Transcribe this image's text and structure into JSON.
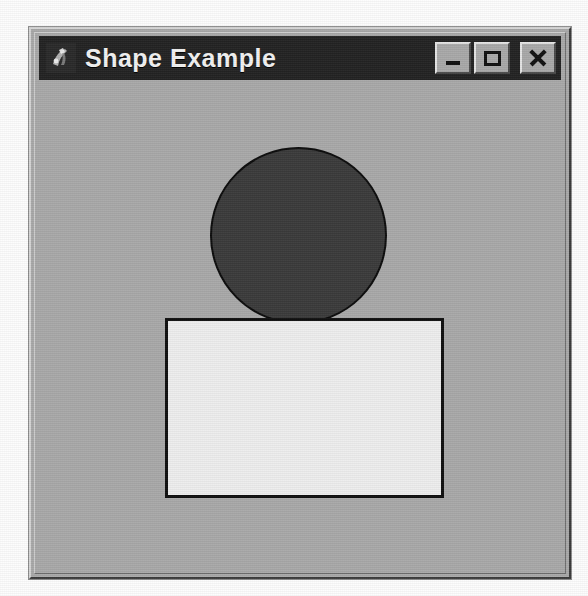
{
  "window": {
    "title": "Shape Example",
    "icon": "application-icon",
    "frame_color": "#a9a9a9",
    "titlebar_color": "#232323",
    "title_text_color": "#f2f2f2"
  },
  "window_controls": [
    {
      "name": "minimize",
      "label": "_",
      "glyph": "minimize-icon"
    },
    {
      "name": "maximize",
      "label": "□",
      "glyph": "maximize-icon"
    },
    {
      "name": "close",
      "label": "×",
      "glyph": "close-icon"
    }
  ],
  "canvas": {
    "background_color": "#a9a9a9",
    "shapes": [
      {
        "name": "circle",
        "type": "ellipse",
        "fill": "#3b3b3b",
        "outline": "#0c0c0c",
        "center_x": 292,
        "center_y": 229,
        "diameter": 177
      },
      {
        "name": "rectangle",
        "type": "rect",
        "fill": "#eeeeee",
        "outline": "#101010",
        "x": 159,
        "y": 312,
        "width": 279,
        "height": 180
      }
    ]
  }
}
